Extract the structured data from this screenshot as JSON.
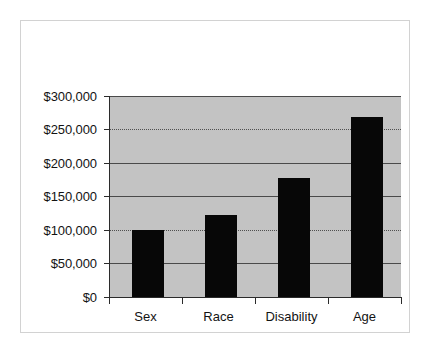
{
  "chart_data": {
    "type": "bar",
    "title": "",
    "subtitle": "",
    "xlabel": "",
    "ylabel": "",
    "categories": [
      "Sex",
      "Race",
      "Disability",
      "Age"
    ],
    "values": [
      100000,
      122000,
      177000,
      269000
    ],
    "series": [
      {
        "name": "",
        "values": [
          100000,
          122000,
          177000,
          269000
        ]
      }
    ],
    "ylim": [
      0,
      300000
    ],
    "ytick_values": [
      0,
      50000,
      100000,
      150000,
      200000,
      250000,
      300000
    ],
    "ytick_labels": [
      "$0",
      "$50,000",
      "$100,000",
      "$150,000",
      "$200,000",
      "$250,000",
      "$300,000"
    ],
    "grid": true,
    "grid_axis": "y",
    "legend": false,
    "legend_position": "none",
    "bar_color": "#070707",
    "plot_background_color": "#c3c3c3",
    "figure_background_color": "#ffffff",
    "gridline_color": "#4a4a4a",
    "axis_color": "#2b2b2b",
    "frame_border_color": "#d2d2d2",
    "annotations": []
  }
}
